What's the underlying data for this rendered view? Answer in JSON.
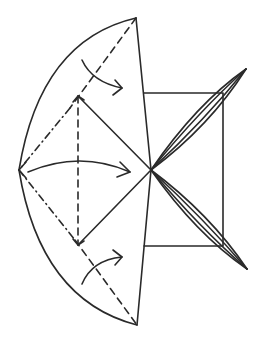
{
  "diagram": {
    "stroke_color": "#2a2a2a",
    "background": "#ffffff",
    "elements": {
      "outer_arc": "curved left edge of folded flap",
      "square": "square base behind",
      "blades": [
        "upper narrow point",
        "lower narrow point"
      ],
      "fold_lines": [
        "valley fold (dashed)",
        "mountain fold (dash-dot)"
      ],
      "arrows": [
        "upper fold arrow",
        "middle fold arrow",
        "lower fold arrow"
      ]
    }
  },
  "caption": {
    "text": ""
  }
}
